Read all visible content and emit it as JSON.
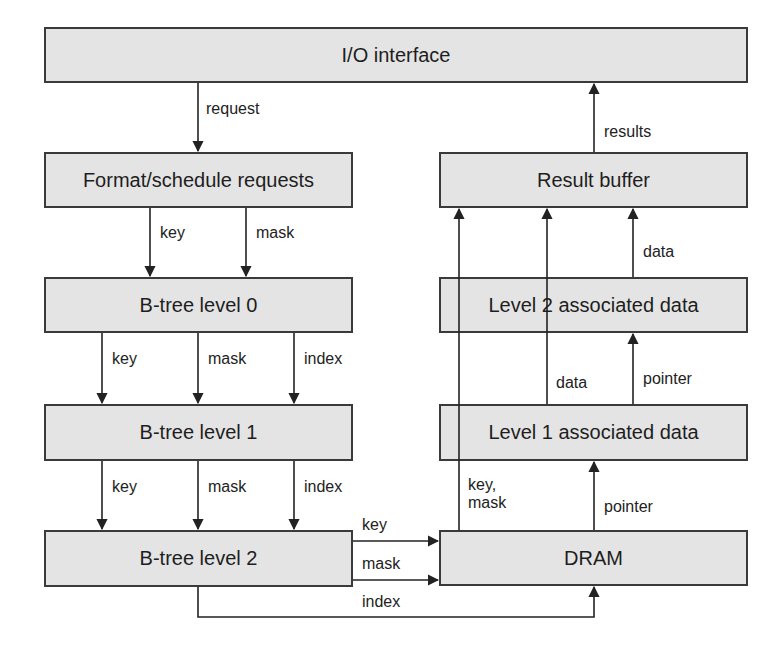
{
  "diagram": {
    "boxes": {
      "io_interface": "I/O interface",
      "format_schedule": "Format/schedule requests",
      "btree_level0": "B-tree level 0",
      "btree_level1": "B-tree level 1",
      "btree_level2": "B-tree level 2",
      "result_buffer": "Result buffer",
      "level2_assoc": "Level 2  associated data",
      "level1_assoc": "Level 1  associated data",
      "dram": "DRAM"
    },
    "labels": {
      "request": "request",
      "results": "results",
      "fmt_key": "key",
      "fmt_mask": "mask",
      "b0_key": "key",
      "b0_mask": "mask",
      "b0_index": "index",
      "b1_key": "key",
      "b1_mask": "mask",
      "b1_index": "index",
      "b2_key": "key",
      "b2_mask": "mask",
      "b2_index": "index",
      "l2_data": "data",
      "l1_data": "data",
      "l1_pointer": "pointer",
      "dram_pointer": "pointer",
      "dram_keymask": "key,\nmask"
    },
    "colors": {
      "box_fill": "#e4e4e4",
      "box_border": "#3a3a3a",
      "line": "#222222",
      "background": "#ffffff"
    }
  }
}
